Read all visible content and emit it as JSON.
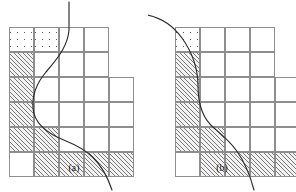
{
  "figure": {
    "type": "diagram",
    "background_color": "#ffffff",
    "line_color": "#2a2a2a",
    "grid_line_color": "#8e8e8e",
    "hatch_color": "#7a7a7a",
    "stipple_color": "#6f6f6f",
    "cell_size_px": 25,
    "fill_legend": {
      "hatch": "hatched (diagonal lines) cell",
      "stipple": "stippled (dotted) cell",
      "white": "empty cell"
    }
  },
  "panels": [
    {
      "id": "a",
      "caption": "(a)",
      "origin": {
        "x": 9,
        "y": 27
      },
      "rows": [
        {
          "row": 1,
          "cells": [
            "stipple",
            "stipple",
            "white",
            "white"
          ]
        },
        {
          "row": 2,
          "cells": [
            "hatch",
            "white",
            "white",
            "white"
          ]
        },
        {
          "row": 3,
          "cells": [
            "hatch",
            "white",
            "white",
            "white",
            "white"
          ]
        },
        {
          "row": 4,
          "cells": [
            "hatch",
            "white",
            "white",
            "white",
            "white"
          ]
        },
        {
          "row": 5,
          "cells": [
            "hatch",
            "hatch",
            "white",
            "white",
            "white"
          ]
        },
        {
          "row": 6,
          "cells": [
            "white",
            "hatch",
            "hatch",
            "hatch",
            "hatch"
          ]
        }
      ],
      "curve": {
        "name": "boundary-curve",
        "path": "M 69 2 L 69 30 C 68 44 60 56 46 72 C 36 84 32 96 33 108 C 34 124 48 134 66 141 C 86 149 102 160 112 190",
        "entry": "top, vertical",
        "exit": "bottom-right"
      }
    },
    {
      "id": "b",
      "caption": "(b)",
      "origin": {
        "x": 27,
        "y": 27
      },
      "rows": [
        {
          "row": 1,
          "cells": [
            "stipple",
            "white",
            "white",
            "white"
          ]
        },
        {
          "row": 2,
          "cells": [
            "hatch",
            "white",
            "white",
            "white"
          ]
        },
        {
          "row": 3,
          "cells": [
            "hatch",
            "white",
            "white",
            "white",
            "white"
          ]
        },
        {
          "row": 4,
          "cells": [
            "hatch",
            "white",
            "white",
            "white",
            "white"
          ]
        },
        {
          "row": 5,
          "cells": [
            "hatch",
            "hatch",
            "white",
            "white",
            "white"
          ]
        },
        {
          "row": 6,
          "cells": [
            "white",
            "hatch",
            "hatch",
            "hatch",
            "hatch"
          ]
        }
      ],
      "curve": {
        "name": "boundary-curve",
        "path": "M -6 14 C 10 16 24 24 34 38 C 44 52 50 68 50 86 C 50 104 54 118 66 128 C 80 140 96 152 106 190",
        "entry": "upper-left, diagonal",
        "exit": "bottom-right"
      }
    }
  ]
}
